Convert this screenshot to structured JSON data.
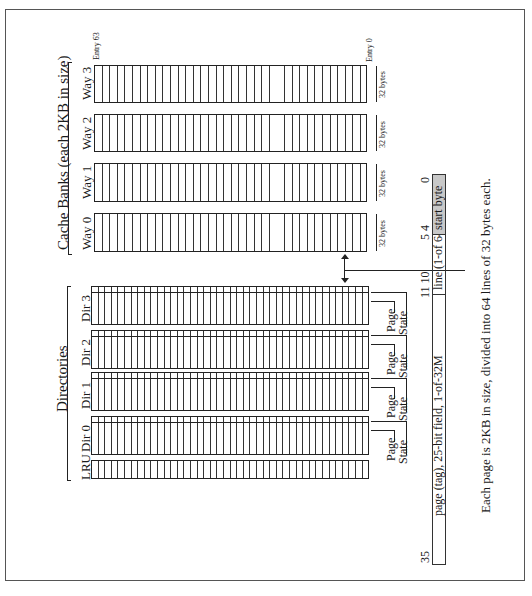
{
  "cache_banks": {
    "title": "Cache Banks (each 2KB in size)",
    "entry_top_label": "Entry 63",
    "entry_bottom_label": "Entry 0",
    "ways": [
      {
        "label": "Way 3",
        "size_label": "32 bytes"
      },
      {
        "label": "Way 2",
        "size_label": "32 bytes"
      },
      {
        "label": "Way 1",
        "size_label": "32 bytes"
      },
      {
        "label": "Way 0",
        "size_label": "32 bytes"
      }
    ]
  },
  "directories": {
    "title": "Directories",
    "dirs": [
      {
        "label": "Dir 3",
        "page_label": "Page",
        "state_label": "State"
      },
      {
        "label": "Dir 2",
        "page_label": "Page",
        "state_label": "State"
      },
      {
        "label": "Dir 1",
        "page_label": "Page",
        "state_label": "State"
      },
      {
        "label": "Dir 0",
        "page_label": "Page",
        "state_label": "State"
      }
    ],
    "lru_label": "LRU"
  },
  "address": {
    "bit_labels": {
      "b35": "35",
      "b11_10": "11 10",
      "b5_4": "5 4",
      "b0": "0"
    },
    "fields": [
      {
        "label": "page (tag), 25-bit field, 1-of-32M"
      },
      {
        "label": "line (1-of 64)"
      },
      {
        "label": "start byte",
        "fill": "#c8c8c8"
      }
    ]
  },
  "caption": "Each page is 2KB in size, divided into 64 lines of 32 bytes each."
}
